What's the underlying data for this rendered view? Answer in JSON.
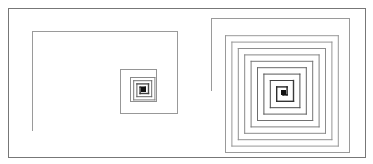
{
  "figure": {
    "frame": {
      "x": 8,
      "y": 8,
      "w": 357,
      "h": 149,
      "color": "#777777"
    },
    "spirals": [
      {
        "name": "left-spiral",
        "start": [
          32,
          130
        ],
        "center": [
          143,
          89
        ],
        "color_outer": "#9a9a9a",
        "color_inner": "#111111",
        "outer_segments": [
          [
            32,
            130
          ],
          [
            32,
            31
          ],
          [
            177,
            31
          ],
          [
            177,
            113
          ],
          [
            120,
            113
          ],
          [
            120,
            69
          ],
          [
            156,
            69
          ],
          [
            156,
            101
          ],
          [
            130,
            101
          ],
          [
            130,
            77
          ]
        ]
      },
      {
        "name": "right-spiral",
        "start": [
          211,
          90
        ],
        "center": [
          283,
          92
        ],
        "color_outer": "#9a9a9a",
        "color_inner": "#111111",
        "outer_segments": [
          [
            211,
            90
          ],
          [
            211,
            18
          ],
          [
            349,
            18
          ],
          [
            349,
            152
          ],
          [
            225,
            152
          ]
        ]
      }
    ]
  }
}
